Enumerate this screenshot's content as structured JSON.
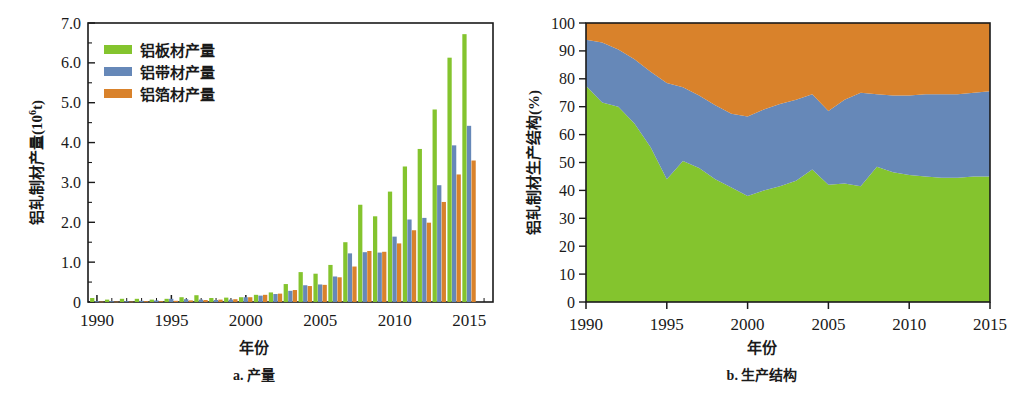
{
  "figure": {
    "panels": [
      {
        "id": "a",
        "caption": "a. 产量",
        "xlabel": "年份",
        "ylabel_text": "铝轧制材产量(10",
        "ylabel_sup": "6",
        "ylabel_tail": "t)"
      },
      {
        "id": "b",
        "caption": "b. 生产结构",
        "xlabel": "年份",
        "ylabel_text": "铝轧制材生产结构(%)"
      }
    ]
  },
  "legend": {
    "items": [
      {
        "label": "铝板材产量",
        "color": "#84C42E"
      },
      {
        "label": "铝带材产量",
        "color": "#6688B8"
      },
      {
        "label": "铝箔材产量",
        "color": "#D9822B"
      }
    ]
  },
  "colors": {
    "plate": "#84C42E",
    "strip": "#6688B8",
    "foil": "#D9822B",
    "axis": "#1a1a1a"
  },
  "chart_data": [
    {
      "type": "bar",
      "title": "a. 产量",
      "xlabel": "年份",
      "ylabel": "铝轧制材产量(10^6 t)",
      "xlim": [
        1989.4,
        2016.6
      ],
      "ylim": [
        0,
        7.0
      ],
      "grid": false,
      "legend_position": "top-left",
      "xticks": [
        1990,
        1995,
        2000,
        2005,
        2010,
        2015
      ],
      "yticks": [
        "0",
        "1.0",
        "2.0",
        "3.0",
        "4.0",
        "5.0",
        "6.0",
        "7.0"
      ],
      "categories": [
        1990,
        1991,
        1992,
        1993,
        1994,
        1995,
        1996,
        1997,
        1998,
        1999,
        2000,
        2001,
        2002,
        2003,
        2004,
        2005,
        2006,
        2007,
        2008,
        2009,
        2010,
        2011,
        2012,
        2013,
        2014,
        2015,
        2016
      ],
      "series": [
        {
          "name": "铝板材产量",
          "color": "#84C42E",
          "values": [
            0.1,
            0.06,
            0.08,
            0.08,
            0.06,
            0.08,
            0.12,
            0.17,
            0.1,
            0.11,
            0.12,
            0.18,
            0.24,
            0.45,
            0.75,
            0.71,
            0.93,
            1.5,
            2.44,
            2.15,
            2.77,
            3.4,
            3.84,
            4.83,
            6.13,
            6.72,
            0
          ]
        },
        {
          "name": "铝带材产量",
          "color": "#6688B8",
          "values": [
            0.02,
            0.02,
            0.02,
            0.03,
            0.04,
            0.08,
            0.07,
            0.06,
            0.05,
            0.06,
            0.12,
            0.16,
            0.2,
            0.28,
            0.42,
            0.44,
            0.64,
            1.22,
            1.25,
            1.24,
            1.64,
            2.07,
            2.11,
            2.93,
            3.93,
            4.42,
            0
          ]
        },
        {
          "name": "铝箔材产量",
          "color": "#D9822B",
          "values": [
            0.01,
            0.01,
            0.01,
            0.02,
            0.02,
            0.03,
            0.04,
            0.05,
            0.06,
            0.07,
            0.12,
            0.18,
            0.21,
            0.3,
            0.4,
            0.43,
            0.62,
            0.89,
            1.28,
            1.26,
            1.47,
            1.8,
            1.99,
            2.51,
            3.2,
            3.55,
            0
          ]
        }
      ]
    },
    {
      "type": "area",
      "stacked": true,
      "normalized": true,
      "title": "b. 生产结构",
      "xlabel": "年份",
      "ylabel": "铝轧制材生产结构(%)",
      "xlim": [
        1990,
        2015
      ],
      "ylim": [
        0,
        100
      ],
      "grid": false,
      "xticks": [
        1990,
        1995,
        2000,
        2005,
        2010,
        2015
      ],
      "yticks": [
        0,
        10,
        20,
        30,
        40,
        50,
        60,
        70,
        80,
        90,
        100
      ],
      "x": [
        1990,
        1991,
        1992,
        1993,
        1994,
        1995,
        1996,
        1997,
        1998,
        1999,
        2000,
        2001,
        2002,
        2003,
        2004,
        2005,
        2006,
        2007,
        2008,
        2009,
        2010,
        2011,
        2012,
        2013,
        2014,
        2015
      ],
      "series": [
        {
          "name": "铝板材产量",
          "color": "#84C42E",
          "values": [
            77.5,
            71.5,
            70.0,
            64.0,
            55.5,
            44.0,
            50.5,
            48.0,
            44.0,
            41.0,
            38.0,
            40.0,
            41.5,
            43.5,
            47.5,
            42.0,
            42.5,
            41.5,
            48.5,
            46.5,
            45.5,
            45.0,
            44.5,
            44.5,
            45.0,
            45.0
          ]
        },
        {
          "name": "铝带材产量",
          "color": "#6688B8",
          "values": [
            16.5,
            21.5,
            20.5,
            23.0,
            27.0,
            34.5,
            26.5,
            26.0,
            26.5,
            26.5,
            28.5,
            29.0,
            29.5,
            29.0,
            27.0,
            26.5,
            30.0,
            33.5,
            26.0,
            27.5,
            28.5,
            29.5,
            30.0,
            30.0,
            30.0,
            30.5
          ]
        },
        {
          "name": "铝箔材产量",
          "color": "#D9822B",
          "values": [
            6.0,
            7.0,
            9.5,
            13.0,
            17.5,
            21.5,
            23.0,
            26.0,
            29.5,
            32.5,
            33.5,
            31.0,
            29.0,
            27.5,
            25.5,
            31.5,
            27.5,
            25.0,
            25.5,
            26.0,
            26.0,
            25.5,
            25.5,
            25.5,
            25.0,
            24.5
          ]
        }
      ]
    }
  ]
}
